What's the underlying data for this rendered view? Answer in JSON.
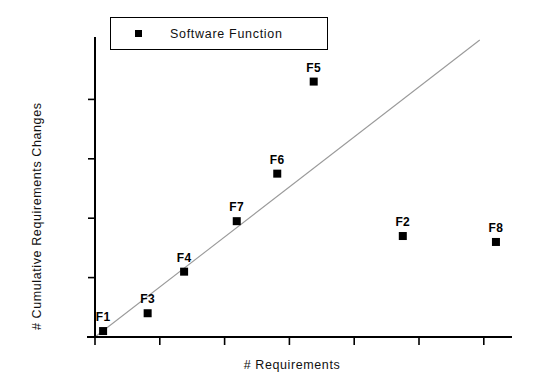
{
  "chart_data": {
    "type": "scatter",
    "title": "",
    "xlabel": "# Requirements",
    "ylabel": "# Cumulative Requirements Changes",
    "legend": {
      "position": "top-left",
      "entries": [
        {
          "label": "Software Function",
          "marker": "filled-square",
          "color": "#000000"
        }
      ]
    },
    "grid": false,
    "axis_tick_labels": false,
    "xlim": [
      0,
      100
    ],
    "ylim": [
      0,
      100
    ],
    "x_ticks": [
      0,
      16,
      32,
      48,
      64,
      80,
      96
    ],
    "y_ticks": [
      0,
      20,
      40,
      60,
      80
    ],
    "points": [
      {
        "label": "F1",
        "x": 2,
        "y": 2
      },
      {
        "label": "F3",
        "x": 13,
        "y": 8
      },
      {
        "label": "F4",
        "x": 22,
        "y": 22
      },
      {
        "label": "F7",
        "x": 35,
        "y": 39
      },
      {
        "label": "F6",
        "x": 45,
        "y": 55
      },
      {
        "label": "F5",
        "x": 54,
        "y": 86
      },
      {
        "label": "F2",
        "x": 76,
        "y": 34
      },
      {
        "label": "F8",
        "x": 99,
        "y": 32
      }
    ],
    "reference_line": {
      "name": "diagonal-trend-line",
      "color": "#9a9a9a",
      "x0": 0,
      "y0": 0,
      "x1": 95,
      "y1": 100
    }
  },
  "colors": {
    "axis": "#000000",
    "marker": "#000000",
    "trend_line": "#9a9a9a",
    "background": "#ffffff"
  }
}
